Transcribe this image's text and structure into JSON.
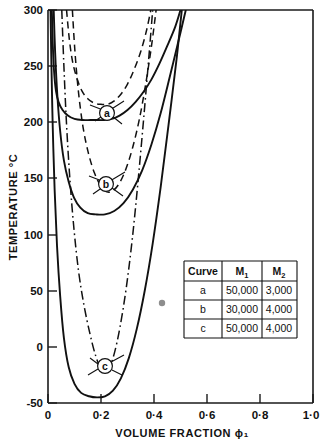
{
  "chart_data": {
    "type": "line",
    "title": "",
    "xlabel": "VOLUME FRACTION ϕ₁",
    "ylabel": "TEMPERATURE °C",
    "xlim": [
      0,
      1.0
    ],
    "ylim": [
      -50,
      300
    ],
    "xticks": [
      0,
      0.2,
      0.4,
      0.6,
      0.8,
      1.0
    ],
    "xticklabels": [
      "0",
      "0·2",
      "0·4",
      "0·6",
      "0·8",
      "1·0"
    ],
    "yticks": [
      -50,
      0,
      50,
      100,
      150,
      200,
      250,
      300
    ],
    "yticklabels": [
      "-50",
      "0",
      "50",
      "100",
      "150",
      "200",
      "250",
      "300"
    ],
    "grid": false,
    "legend": "none",
    "annotations": [
      "a",
      "b",
      "c"
    ],
    "series": [
      {
        "name": "a binodal",
        "curve": "a",
        "kind": "binodal",
        "style": "solid",
        "minimum": {
          "x": 0.21,
          "y": 202
        },
        "points": [
          [
            0.0145,
            300
          ],
          [
            0.018,
            270
          ],
          [
            0.023,
            245
          ],
          [
            0.03,
            228
          ],
          [
            0.04,
            218
          ],
          [
            0.055,
            211
          ],
          [
            0.075,
            206
          ],
          [
            0.1,
            203
          ],
          [
            0.13,
            202
          ],
          [
            0.16,
            202
          ],
          [
            0.19,
            202
          ],
          [
            0.21,
            202
          ],
          [
            0.24,
            203
          ],
          [
            0.27,
            206
          ],
          [
            0.3,
            211
          ],
          [
            0.33,
            218
          ],
          [
            0.36,
            227
          ],
          [
            0.39,
            238
          ],
          [
            0.42,
            252
          ],
          [
            0.45,
            268
          ],
          [
            0.48,
            285
          ],
          [
            0.5,
            300
          ]
        ]
      },
      {
        "name": "a spinodal",
        "curve": "a",
        "kind": "spinodal",
        "style": "dashed",
        "minimum": {
          "x": 0.215,
          "y": 216
        },
        "points": [
          [
            0.07,
            300
          ],
          [
            0.08,
            275
          ],
          [
            0.092,
            255
          ],
          [
            0.108,
            240
          ],
          [
            0.128,
            228
          ],
          [
            0.15,
            221
          ],
          [
            0.175,
            217
          ],
          [
            0.2,
            216
          ],
          [
            0.225,
            216
          ],
          [
            0.25,
            219
          ],
          [
            0.275,
            225
          ],
          [
            0.3,
            234
          ],
          [
            0.325,
            247
          ],
          [
            0.35,
            263
          ],
          [
            0.372,
            282
          ],
          [
            0.388,
            300
          ]
        ]
      },
      {
        "name": "b binodal",
        "curve": "b",
        "kind": "binodal",
        "style": "solid",
        "minimum": {
          "x": 0.215,
          "y": 118
        },
        "points": [
          [
            0.0215,
            300
          ],
          [
            0.027,
            262
          ],
          [
            0.035,
            225
          ],
          [
            0.046,
            192
          ],
          [
            0.06,
            166
          ],
          [
            0.078,
            147
          ],
          [
            0.098,
            133
          ],
          [
            0.122,
            124
          ],
          [
            0.15,
            119
          ],
          [
            0.18,
            118
          ],
          [
            0.215,
            118
          ],
          [
            0.25,
            121
          ],
          [
            0.285,
            128
          ],
          [
            0.32,
            140
          ],
          [
            0.355,
            157
          ],
          [
            0.39,
            180
          ],
          [
            0.425,
            208
          ],
          [
            0.46,
            241
          ],
          [
            0.495,
            275
          ],
          [
            0.52,
            300
          ]
        ]
      },
      {
        "name": "b spinodal",
        "curve": "b",
        "kind": "spinodal",
        "style": "dashed",
        "minimum": {
          "x": 0.215,
          "y": 138
        },
        "points": [
          [
            0.092,
            300
          ],
          [
            0.102,
            262
          ],
          [
            0.115,
            227
          ],
          [
            0.132,
            196
          ],
          [
            0.152,
            173
          ],
          [
            0.175,
            155
          ],
          [
            0.2,
            143
          ],
          [
            0.222,
            138
          ],
          [
            0.245,
            139
          ],
          [
            0.27,
            146
          ],
          [
            0.295,
            159
          ],
          [
            0.32,
            178
          ],
          [
            0.345,
            203
          ],
          [
            0.368,
            233
          ],
          [
            0.39,
            267
          ],
          [
            0.408,
            300
          ]
        ]
      },
      {
        "name": "c binodal",
        "curve": "c",
        "kind": "binodal",
        "style": "solid",
        "minimum": {
          "x": 0.205,
          "y": -44
        },
        "points": [
          [
            0.0095,
            300
          ],
          [
            0.013,
            250
          ],
          [
            0.018,
            195
          ],
          [
            0.025,
            140
          ],
          [
            0.034,
            90
          ],
          [
            0.046,
            45
          ],
          [
            0.06,
            8
          ],
          [
            0.078,
            -18
          ],
          [
            0.1,
            -33
          ],
          [
            0.125,
            -41
          ],
          [
            0.155,
            -44
          ],
          [
            0.185,
            -45
          ],
          [
            0.215,
            -44
          ],
          [
            0.245,
            -39
          ],
          [
            0.275,
            -28
          ],
          [
            0.305,
            -10
          ],
          [
            0.335,
            16
          ],
          [
            0.365,
            50
          ],
          [
            0.395,
            92
          ],
          [
            0.425,
            142
          ],
          [
            0.455,
            198
          ],
          [
            0.485,
            256
          ],
          [
            0.505,
            300
          ]
        ]
      },
      {
        "name": "c spinodal",
        "curve": "c",
        "kind": "spinodal",
        "style": "dash-dot",
        "minimum": {
          "x": 0.205,
          "y": -22
        },
        "points": [
          [
            0.052,
            300
          ],
          [
            0.06,
            250
          ],
          [
            0.07,
            198
          ],
          [
            0.083,
            148
          ],
          [
            0.098,
            105
          ],
          [
            0.115,
            68
          ],
          [
            0.135,
            38
          ],
          [
            0.158,
            12
          ],
          [
            0.18,
            -8
          ],
          [
            0.205,
            -22
          ],
          [
            0.228,
            -20
          ],
          [
            0.25,
            -6
          ],
          [
            0.272,
            18
          ],
          [
            0.295,
            52
          ],
          [
            0.318,
            96
          ],
          [
            0.34,
            148
          ],
          [
            0.362,
            206
          ],
          [
            0.382,
            262
          ],
          [
            0.395,
            300
          ]
        ]
      }
    ]
  },
  "curve_labels": [
    {
      "id": "a",
      "text": "a"
    },
    {
      "id": "b",
      "text": "b"
    },
    {
      "id": "c",
      "text": "c"
    }
  ],
  "table": {
    "headers": [
      "Curve",
      "M₁",
      "M₂"
    ],
    "header_plain": [
      "Curve",
      "M1",
      "M2"
    ],
    "rows": [
      {
        "curve": "a",
        "m1": "50,000",
        "m2": "3,000"
      },
      {
        "curve": "b",
        "m1": "30,000",
        "m2": "4,000"
      },
      {
        "curve": "c",
        "m1": "50,000",
        "m2": "4,000"
      }
    ]
  },
  "colors": {
    "ink": "#111111",
    "background": "#ffffff",
    "speck": "#8d8d8d"
  }
}
